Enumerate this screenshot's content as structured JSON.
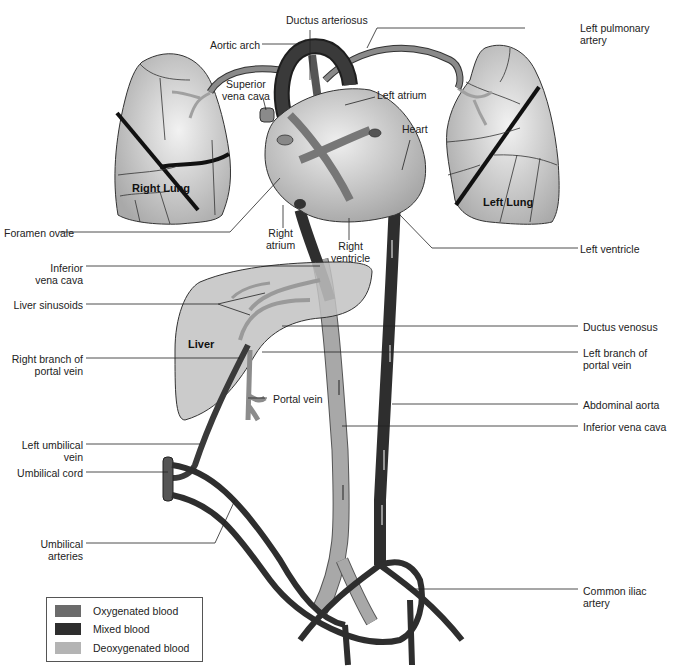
{
  "diagram": {
    "organs": {
      "right_lung": "Right  Lung",
      "left_lung": "Left  Lung",
      "liver": "Liver",
      "heart": "Heart"
    },
    "labels_left": [
      {
        "id": "aortic-arch",
        "text": "Aortic arch"
      },
      {
        "id": "superior-vena-cava",
        "text": "Superior\nvena cava"
      },
      {
        "id": "foramen-ovale",
        "text": "Foramen ovale"
      },
      {
        "id": "inferior-vena-cava-upper",
        "text": "Inferior\nvena cava"
      },
      {
        "id": "liver-sinusoids",
        "text": "Liver sinusoids"
      },
      {
        "id": "right-branch-portal-vein",
        "text": "Right branch of\nportal vein"
      },
      {
        "id": "left-umbilical-vein",
        "text": "Left umbilical\nvein"
      },
      {
        "id": "umbilical-cord",
        "text": "Umbilical cord"
      },
      {
        "id": "umbilical-arteries",
        "text": "Umbilical\narteries"
      }
    ],
    "labels_center": [
      {
        "id": "ductus-arteriosus",
        "text": "Ductus arteriosus"
      },
      {
        "id": "left-atrium",
        "text": "Left atrium"
      },
      {
        "id": "right-atrium",
        "text": "Right\natrium"
      },
      {
        "id": "right-ventricle",
        "text": "Right\nventricle"
      },
      {
        "id": "portal-vein",
        "text": "Portal vein"
      }
    ],
    "labels_right": [
      {
        "id": "left-pulmonary-artery",
        "text": "Left pulmonary\nartery"
      },
      {
        "id": "left-ventricle",
        "text": "Left ventricle"
      },
      {
        "id": "ductus-venosus",
        "text": "Ductus venosus"
      },
      {
        "id": "left-branch-portal-vein",
        "text": "Left branch of\nportal vein"
      },
      {
        "id": "abdominal-aorta",
        "text": "Abdominal aorta"
      },
      {
        "id": "inferior-vena-cava-lower",
        "text": "Inferior vena cava"
      },
      {
        "id": "common-iliac-artery",
        "text": "Common iliac\nartery"
      }
    ],
    "legend": {
      "items": [
        {
          "label": "Oxygenated blood",
          "color": "#6b6b6b"
        },
        {
          "label": "Mixed blood",
          "color": "#2e2e2e"
        },
        {
          "label": "Deoxygenated blood",
          "color": "#b4b4b4"
        }
      ]
    },
    "colors": {
      "oxygenated": "#6b6b6b",
      "mixed": "#2e2e2e",
      "deoxygenated": "#a8a8a8",
      "organ_fill": "#c8c8c8",
      "outline": "#333333"
    }
  }
}
